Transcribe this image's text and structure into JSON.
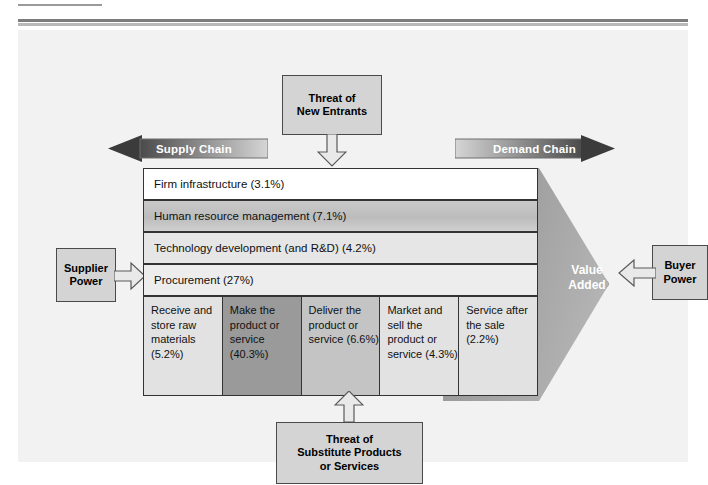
{
  "diagram": {
    "top_force": {
      "line1": "Threat of",
      "line2": "New Entrants"
    },
    "bottom_force": {
      "line1": "Threat of",
      "line2": "Substitute Products",
      "line3": "or Services"
    },
    "left_force": {
      "line1": "Supplier",
      "line2": "Power"
    },
    "right_force": {
      "line1": "Buyer",
      "line2": "Power"
    },
    "supply_chain_label": "Supply Chain",
    "demand_chain_label": "Demand Chain",
    "value_added": {
      "line1": "Value",
      "line2": "Added"
    },
    "support_activities": [
      {
        "label": "Firm infrastructure (3.1%)",
        "percent": "3.1%"
      },
      {
        "label": "Human resource management (7.1%)",
        "percent": "7.1%"
      },
      {
        "label": "Technology development (and R&D) (4.2%)",
        "percent": "4.2%"
      },
      {
        "label": "Procurement (27%)",
        "percent": "27%"
      }
    ],
    "primary_activities": [
      {
        "label": "Receive and store raw materials (5.2%)",
        "percent": "5.2%"
      },
      {
        "label": "Make the product or service (40.3%)",
        "percent": "40.3%"
      },
      {
        "label": "Deliver the product or service (6.6%)",
        "percent": "6.6%"
      },
      {
        "label": "Market and sell the product or service (4.3%)",
        "percent": "4.3%"
      },
      {
        "label": "Service after the sale (2.2%)",
        "percent": "2.2%"
      }
    ]
  },
  "colors": {
    "panel_bg": "#f2f2f2",
    "box_fill": "#d4d4d4",
    "chevron_fill": "#9d9d9d",
    "arrow_dark": "#3b3b3b",
    "row_white": "#ffffff",
    "row_gray": "#c9c9c9",
    "cell_dark": "#9a9a9a",
    "cell_mid": "#c4c4c4",
    "cell_light": "#e2e2e2"
  }
}
